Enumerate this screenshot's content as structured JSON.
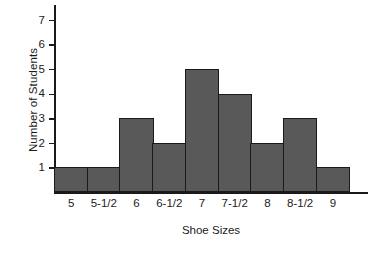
{
  "chart_data": {
    "type": "bar",
    "title": "",
    "xlabel": "Shoe Sizes",
    "ylabel": "Number of Students",
    "categories": [
      "5",
      "5-1/2",
      "6",
      "6-1/2",
      "7",
      "7-1/2",
      "8",
      "8-1/2",
      "9"
    ],
    "values": [
      1,
      1,
      3,
      2,
      5,
      4,
      2,
      3,
      1
    ],
    "ylim": [
      0,
      7.6
    ],
    "yticks": [
      1,
      2,
      3,
      4,
      5,
      6,
      7
    ],
    "ytick_labels": [
      "1",
      "2",
      "3",
      "4",
      "5",
      "6",
      "7"
    ],
    "grid": false,
    "legend": null,
    "bar_color": "#595959",
    "bar_edge_color": "#1a1a1a",
    "axis_color": "#1a1a1a",
    "background_color": "#ffffff"
  }
}
